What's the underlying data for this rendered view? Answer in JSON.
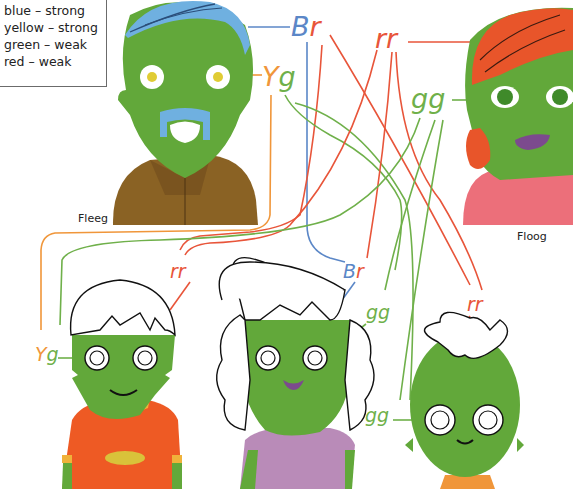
{
  "legend": {
    "items": [
      {
        "text": "blue – strong",
        "allele": "B",
        "trait": "blue",
        "dominance": "strong"
      },
      {
        "text": "yellow – strong",
        "allele": "Y",
        "trait": "yellow",
        "dominance": "strong"
      },
      {
        "text": "green – weak",
        "allele": "g",
        "trait": "green",
        "dominance": "weak"
      },
      {
        "text": "red – weak",
        "allele": "r",
        "trait": "red",
        "dominance": "weak"
      }
    ]
  },
  "parents": {
    "fleeg": {
      "name": "Fleeg",
      "hair_genes": "Br",
      "eye_genes": "Yg"
    },
    "floog": {
      "name": "Floog",
      "hair_genes": "rr",
      "eye_genes": "gg"
    }
  },
  "children": [
    {
      "hair_genes": "rr",
      "eye_genes": "Yg"
    },
    {
      "hair_genes": "Br",
      "eye_genes": "gg"
    },
    {
      "hair_genes": "rr",
      "eye_genes": "gg"
    }
  ],
  "colors": {
    "blue": "#5b87c7",
    "red": "#e8553a",
    "orange": "#f0963a",
    "green": "#6fb04a",
    "skin": "#62a83a",
    "hair_blue": "#6fb0e0",
    "hair_red": "#e8552a",
    "shirt_brown": "#8a6224",
    "shirt_pink": "#ec6f7a",
    "shirt_orange": "#ee5a24",
    "shirt_lilac": "#b98bb8"
  }
}
